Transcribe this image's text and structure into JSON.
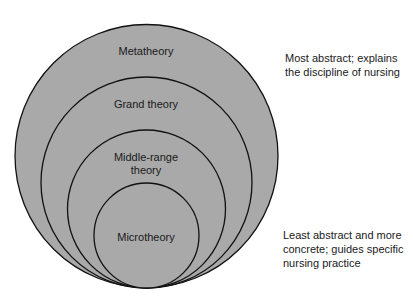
{
  "diagram": {
    "type": "nested-circles",
    "fill_color": "#a9a9a9",
    "stroke_color": "#111111",
    "levels": [
      {
        "id": "metatheory",
        "label_lines": [
          "Metatheory"
        ]
      },
      {
        "id": "grand",
        "label_lines": [
          "Grand theory"
        ]
      },
      {
        "id": "middle-range",
        "label_lines": [
          "Middle-range",
          "theory"
        ]
      },
      {
        "id": "micro",
        "label_lines": [
          "Microtheory"
        ]
      }
    ],
    "annotations": {
      "top": [
        "Most abstract; explains",
        "the discipline of nursing"
      ],
      "bottom": [
        "Least abstract and more",
        "concrete; guides specific",
        "nursing practice"
      ]
    }
  }
}
